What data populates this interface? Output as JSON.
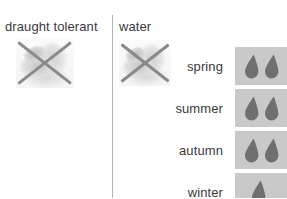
{
  "panel": {
    "columns": [
      {
        "key": "draught_tolerant",
        "header": "draught tolerant",
        "icon": "crossed-out-plant-icon",
        "state": "crossed-out"
      },
      {
        "key": "water",
        "header": "water",
        "icon": "crossed-out-watering-icon",
        "state": "crossed-out"
      }
    ],
    "seasons": [
      {
        "label": "spring",
        "droplets": 2
      },
      {
        "label": "summer",
        "droplets": 2
      },
      {
        "label": "autumn",
        "droplets": 2
      },
      {
        "label": "winter",
        "droplets": 1
      }
    ],
    "colors": {
      "background": "#ffffff",
      "text": "#3a3a3a",
      "divider": "#b5b5b5",
      "tile": "#c9c9c9",
      "droplet": "#6f6f6f",
      "cross": "#8a8a8a"
    }
  }
}
